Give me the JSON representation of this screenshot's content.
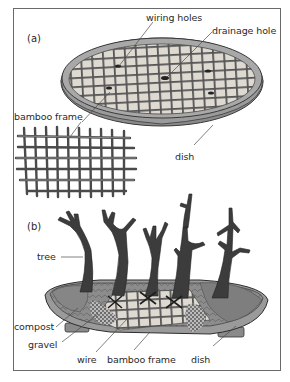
{
  "figure": {
    "panel_a": {
      "id": "(a)",
      "labels": {
        "wiring_holes": "wiring holes",
        "drainage_hole": "drainage hole",
        "bamboo_frame": "bamboo frame",
        "dish": "dish"
      }
    },
    "panel_b": {
      "id": "(b)",
      "labels": {
        "tree": "tree",
        "compost": "compost",
        "gravel": "gravel",
        "wire": "wire",
        "bamboo_frame": "bamboo frame",
        "dish": "dish"
      }
    },
    "colors": {
      "ink": "#2a2a2a",
      "frame_border": "#6a6a6a",
      "dish_rim": "#7a7a7a",
      "dish_inner": "#b8b8b8",
      "soil_tile": "#e4e0d8",
      "bamboo": "#5a5a5a",
      "tree": "#3c3c3c",
      "compost": "#8a8a8a",
      "gravel": "#6e6e6e"
    }
  }
}
